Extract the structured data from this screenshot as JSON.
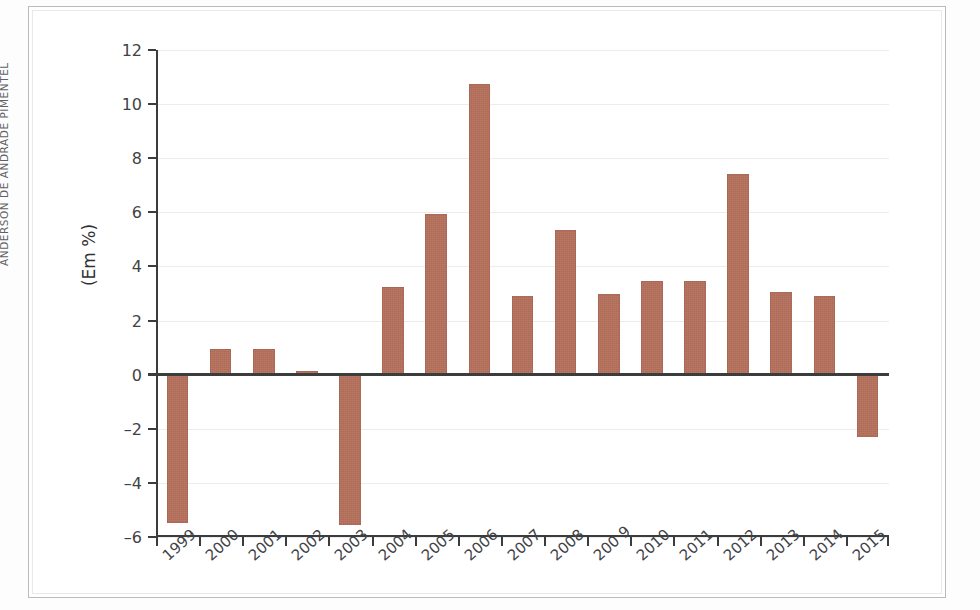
{
  "credit": {
    "text": "ANDERSON DE ANDRADE PIMENTEL"
  },
  "colors": {
    "bar": "#b5705c",
    "axis": "#3a3c3e",
    "grid": "#ececec",
    "frame": "#b9bcbe"
  },
  "chart_data": {
    "type": "bar",
    "title": "",
    "xlabel": "",
    "ylabel": "(Em %)",
    "ylim": [
      -6,
      12
    ],
    "yticks": [
      12,
      10,
      8,
      6,
      4,
      2,
      0,
      -2,
      -4,
      -6
    ],
    "ytick_labels": [
      "12",
      "10",
      "8",
      "6",
      "4",
      "2",
      "0",
      "–2",
      "–4",
      "–6"
    ],
    "grid": true,
    "legend": "none",
    "categories": [
      "1999",
      "2000",
      "2001",
      "2002",
      "2003",
      "2004",
      "2005",
      "2006",
      "2007",
      "2008",
      "200 9",
      "2010",
      "2011",
      "2012",
      "2013",
      "2014",
      "2015"
    ],
    "values": [
      -5.5,
      0.95,
      0.95,
      0.15,
      -5.55,
      3.25,
      5.95,
      10.75,
      2.9,
      5.35,
      3.0,
      3.45,
      3.45,
      7.4,
      3.05,
      2.9,
      -2.3
    ],
    "series": [
      {
        "name": "",
        "values": [
          -5.5,
          0.95,
          0.95,
          0.15,
          -5.55,
          3.25,
          5.95,
          10.75,
          2.9,
          5.35,
          3.0,
          3.45,
          3.45,
          7.4,
          3.05,
          2.9,
          -2.3
        ]
      }
    ]
  }
}
